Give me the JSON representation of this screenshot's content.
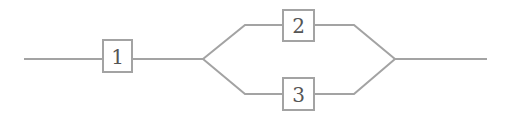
{
  "diagram": {
    "type": "reliability-block-diagram",
    "colors": {
      "line": "#a3a3a3",
      "label": "#555555",
      "background": "#ffffff"
    },
    "blocks": [
      {
        "id": "1",
        "label": "1",
        "x": 103,
        "y": 40,
        "w": 29,
        "h": 32
      },
      {
        "id": "2",
        "label": "2",
        "x": 283,
        "y": 10,
        "w": 31,
        "h": 31
      },
      {
        "id": "3",
        "label": "3",
        "x": 283,
        "y": 78,
        "w": 31,
        "h": 32
      }
    ],
    "connections": [
      {
        "from": "input",
        "to": "1"
      },
      {
        "from": "1",
        "to": "split"
      },
      {
        "from": "split",
        "to": "2"
      },
      {
        "from": "split",
        "to": "3"
      },
      {
        "from": "2",
        "to": "join"
      },
      {
        "from": "3",
        "to": "join"
      },
      {
        "from": "join",
        "to": "output"
      }
    ],
    "structure": "Block 1 in series with parallel blocks 2 and 3"
  }
}
